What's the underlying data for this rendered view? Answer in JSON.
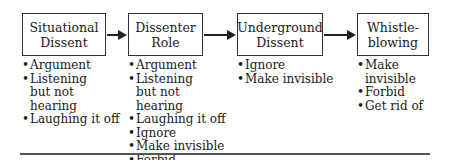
{
  "stages": [
    {
      "title_lines": [
        "Situational",
        "Dissent"
      ],
      "items": [
        "Argument",
        "Listening but not hearing",
        "Laughing it off"
      ]
    },
    {
      "title_lines": [
        "Dissenter",
        "Role"
      ],
      "items": [
        "Argument",
        "Listening but not hearing",
        "Laughing it off",
        "Ignore",
        "Make invisible",
        "Forbid"
      ]
    },
    {
      "title_lines": [
        "Underground",
        "Dissent"
      ],
      "items": [
        "Ignore",
        "Make invisible"
      ]
    },
    {
      "title_lines": [
        "Whistle-",
        "blowing"
      ],
      "items": [
        "Make invisible",
        "Forbid",
        "Get rid of"
      ]
    }
  ]
}
